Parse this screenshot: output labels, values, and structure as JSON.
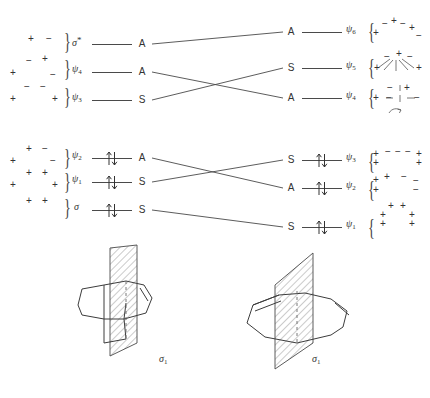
{
  "diagram": {
    "title_hidden": "orbital correlation diagram",
    "left_column": {
      "upper_levels": [
        {
          "orbital": "σ",
          "orbital_superscript": "*",
          "symmetry": "A",
          "signs": [
            {
              "text": "+",
              "x": 28,
              "y": 40
            },
            {
              "text": "−",
              "x": 46,
              "y": 40
            }
          ]
        },
        {
          "orbital": "ψ",
          "orbital_subscript": "4",
          "symmetry": "A",
          "signs": [
            {
              "text": "−",
              "x": 26,
              "y": 62
            },
            {
              "text": "+",
              "x": 42,
              "y": 60
            },
            {
              "text": "+",
              "x": 10,
              "y": 74
            },
            {
              "text": "−",
              "x": 50,
              "y": 76
            }
          ]
        },
        {
          "orbital": "ψ",
          "orbital_subscript": "3",
          "symmetry": "S",
          "signs": [
            {
              "text": "−",
              "x": 24,
              "y": 88
            },
            {
              "text": "−",
              "x": 40,
              "y": 88
            },
            {
              "text": "+",
              "x": 10,
              "y": 100
            },
            {
              "text": "+",
              "x": 52,
              "y": 100
            }
          ]
        }
      ],
      "lower_levels": [
        {
          "orbital": "ψ",
          "orbital_subscript": "2",
          "symmetry": "A",
          "occupied": true,
          "signs": [
            {
              "text": "+",
              "x": 26,
              "y": 150
            },
            {
              "text": "−",
              "x": 42,
              "y": 150
            },
            {
              "text": "+",
              "x": 10,
              "y": 162
            },
            {
              "text": "−",
              "x": 50,
              "y": 162
            }
          ]
        },
        {
          "orbital": "ψ",
          "orbital_subscript": "1",
          "symmetry": "S",
          "occupied": true,
          "signs": [
            {
              "text": "+",
              "x": 26,
              "y": 174
            },
            {
              "text": "+",
              "x": 42,
              "y": 174
            },
            {
              "text": "+",
              "x": 10,
              "y": 186
            },
            {
              "text": "+",
              "x": 52,
              "y": 186
            }
          ]
        },
        {
          "orbital": "σ",
          "symmetry": "S",
          "occupied": true,
          "signs": [
            {
              "text": "+",
              "x": 26,
              "y": 202
            },
            {
              "text": "+",
              "x": 42,
              "y": 202
            }
          ]
        }
      ]
    },
    "right_column": {
      "upper_levels": [
        {
          "symmetry": "A",
          "orbital": "ψ",
          "orbital_subscript": "6",
          "signs": [
            {
              "text": "−",
              "x": 382,
              "y": 24
            },
            {
              "text": "+",
              "x": 391,
              "y": 21
            },
            {
              "text": "−",
              "x": 400,
              "y": 24
            },
            {
              "text": "+",
              "x": 409,
              "y": 28
            },
            {
              "text": "+",
              "x": 373,
              "y": 33
            },
            {
              "text": "−",
              "x": 416,
              "y": 36
            }
          ]
        },
        {
          "symmetry": "S",
          "orbital": "ψ",
          "orbital_subscript": "5",
          "signs": [
            {
              "text": "−",
              "x": 384,
              "y": 58
            },
            {
              "text": "+",
              "x": 396,
              "y": 54
            },
            {
              "text": "−",
              "x": 407,
              "y": 58
            },
            {
              "text": "+",
              "x": 374,
              "y": 68
            },
            {
              "text": "+",
              "x": 416,
              "y": 68
            }
          ]
        },
        {
          "symmetry": "A",
          "orbital": "ψ",
          "orbital_subscript": "4",
          "signs": [
            {
              "text": "−",
              "x": 387,
              "y": 88
            },
            {
              "text": "+",
              "x": 404,
              "y": 88
            },
            {
              "text": "−",
              "x": 375,
              "y": 98
            },
            {
              "text": "+",
              "x": 373,
              "y": 98
            },
            {
              "text": "−",
              "x": 414,
              "y": 98
            }
          ]
        }
      ],
      "lower_levels": [
        {
          "symmetry": "S",
          "orbital": "ψ",
          "orbital_subscript": "3",
          "occupied": true,
          "signs": [
            {
              "text": "+",
              "x": 373,
              "y": 154
            },
            {
              "text": "−",
              "x": 385,
              "y": 152
            },
            {
              "text": "−",
              "x": 395,
              "y": 152
            },
            {
              "text": "−",
              "x": 405,
              "y": 152
            },
            {
              "text": "+",
              "x": 416,
              "y": 154
            },
            {
              "text": "+",
              "x": 373,
              "y": 164
            },
            {
              "text": "+",
              "x": 416,
              "y": 164
            }
          ]
        },
        {
          "symmetry": "A",
          "orbital": "ψ",
          "orbital_subscript": "2",
          "occupied": true,
          "signs": [
            {
              "text": "+",
              "x": 373,
              "y": 180
            },
            {
              "text": "+",
              "x": 384,
              "y": 177
            },
            {
              "text": "−",
              "x": 401,
              "y": 177
            },
            {
              "text": "−",
              "x": 413,
              "y": 181
            },
            {
              "text": "+",
              "x": 373,
              "y": 190
            },
            {
              "text": "−",
              "x": 413,
              "y": 190
            }
          ]
        },
        {
          "symmetry": "S",
          "orbital": "ψ",
          "orbital_subscript": "1",
          "occupied": true,
          "signs": [
            {
              "text": "+",
              "x": 388,
              "y": 206
            },
            {
              "text": "+",
              "x": 400,
              "y": 206
            },
            {
              "text": "+",
              "x": 380,
              "y": 215
            },
            {
              "text": "+",
              "x": 409,
              "y": 215
            },
            {
              "text": "+",
              "x": 380,
              "y": 223
            },
            {
              "text": "+",
              "x": 409,
              "y": 223
            }
          ]
        }
      ]
    },
    "structures": [
      {
        "label": "σ",
        "label_subscript": "1",
        "name": "reactant-structure"
      },
      {
        "label": "σ",
        "label_subscript": "1",
        "name": "product-structure"
      }
    ]
  }
}
